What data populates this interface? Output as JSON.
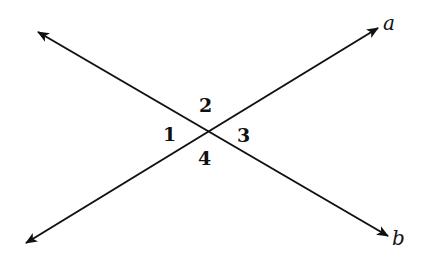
{
  "diagram": {
    "type": "intersecting-lines",
    "stroke_color": "#111111",
    "background": "#ffffff",
    "lines": [
      {
        "name": "a",
        "label": "a",
        "from": [
          26,
          243
        ],
        "to": [
          378,
          28
        ]
      },
      {
        "name": "b",
        "label": "b",
        "from": [
          38,
          32
        ],
        "to": [
          388,
          236
        ]
      }
    ],
    "intersection": [
      207,
      131
    ],
    "angles": [
      {
        "id": "1",
        "label": "1",
        "x": 163,
        "y": 141
      },
      {
        "id": "2",
        "label": "2",
        "x": 199,
        "y": 112
      },
      {
        "id": "3",
        "label": "3",
        "x": 237,
        "y": 142
      },
      {
        "id": "4",
        "label": "4",
        "x": 198,
        "y": 165
      }
    ]
  }
}
